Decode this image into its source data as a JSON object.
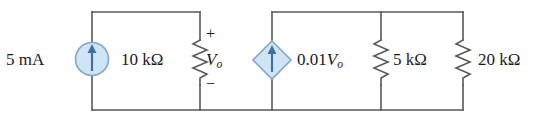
{
  "diagram": {
    "wire_color": "#595959",
    "source_fill": "#cfe4f5",
    "source_stroke": "#7fa8cc",
    "arrow_color": "#3f6fa8"
  },
  "elements": {
    "independent_source": {
      "name": "independent-current-source",
      "symbol": "circle",
      "label": "5 mA",
      "arrow_direction": "up"
    },
    "resistor_10k": {
      "name": "resistor-10k",
      "symbol": "zigzag",
      "label": "10 kΩ"
    },
    "voltage_label": {
      "name": "voltage-vo",
      "var": "V",
      "sub": "o",
      "plus": "+",
      "minus": "−"
    },
    "dependent_source": {
      "name": "dependent-current-source",
      "symbol": "diamond",
      "coefficient": "0.01",
      "var": "V",
      "sub": "o",
      "arrow_direction": "up"
    },
    "resistor_5k": {
      "name": "resistor-5k",
      "symbol": "zigzag",
      "label": "5 kΩ"
    },
    "resistor_20k": {
      "name": "resistor-20k",
      "symbol": "zigzag",
      "label": "20 kΩ"
    }
  }
}
